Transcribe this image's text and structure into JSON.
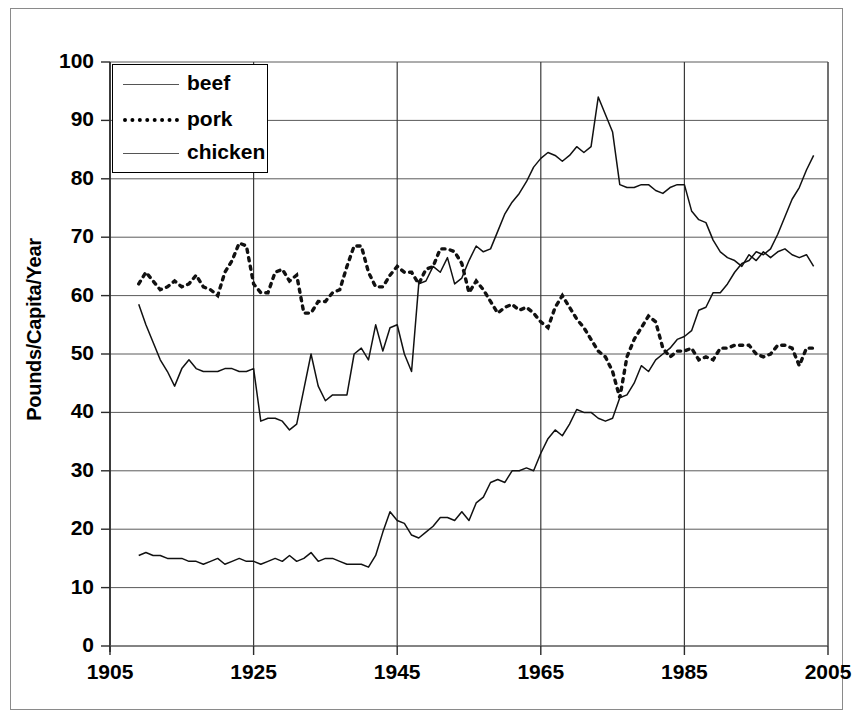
{
  "chart_data": {
    "type": "line",
    "title": "",
    "xlabel": "",
    "ylabel": "Pounds/Capita/Year",
    "xlim": [
      1905,
      2005
    ],
    "ylim": [
      0,
      100
    ],
    "xticks": [
      "1905",
      "1925",
      "1945",
      "1965",
      "1985",
      "2005"
    ],
    "yticks": [
      "0",
      "10",
      "20",
      "30",
      "40",
      "50",
      "60",
      "70",
      "80",
      "90",
      "100"
    ],
    "grid": true,
    "legend": {
      "position": "top-left",
      "entries": [
        {
          "label": "beef",
          "style": "solid"
        },
        {
          "label": "pork",
          "style": "dotted"
        },
        {
          "label": "chicken",
          "style": "solid"
        }
      ]
    },
    "x": [
      1909,
      1910,
      1911,
      1912,
      1913,
      1914,
      1915,
      1916,
      1917,
      1918,
      1919,
      1920,
      1921,
      1922,
      1923,
      1924,
      1925,
      1926,
      1927,
      1928,
      1929,
      1930,
      1931,
      1932,
      1933,
      1934,
      1935,
      1936,
      1937,
      1938,
      1939,
      1940,
      1941,
      1942,
      1943,
      1944,
      1945,
      1946,
      1947,
      1948,
      1949,
      1950,
      1951,
      1952,
      1953,
      1954,
      1955,
      1956,
      1957,
      1958,
      1959,
      1960,
      1961,
      1962,
      1963,
      1964,
      1965,
      1966,
      1967,
      1968,
      1969,
      1970,
      1971,
      1972,
      1973,
      1974,
      1975,
      1976,
      1977,
      1978,
      1979,
      1980,
      1981,
      1982,
      1983,
      1984,
      1985,
      1986,
      1987,
      1988,
      1989,
      1990,
      1991,
      1992,
      1993,
      1994,
      1995,
      1996,
      1997,
      1998,
      1999,
      2000,
      2001,
      2002,
      2003
    ],
    "series": [
      {
        "name": "beef",
        "style": "solid",
        "values": [
          58.5,
          55.0,
          52.0,
          49.0,
          47.0,
          44.5,
          47.5,
          49.0,
          47.5,
          47.0,
          47.0,
          47.0,
          47.5,
          47.5,
          47.0,
          47.0,
          47.5,
          38.5,
          39.0,
          39.0,
          38.5,
          37.0,
          38.0,
          44.0,
          50.0,
          44.5,
          42.0,
          43.0,
          43.0,
          43.0,
          50.0,
          51.0,
          49.0,
          55.0,
          50.5,
          54.5,
          55.0,
          50.0,
          47.0,
          62.0,
          62.5,
          65.0,
          64.0,
          66.5,
          62.0,
          63.0,
          66.0,
          68.5,
          67.5,
          68.0,
          71.0,
          74.0,
          76.0,
          77.5,
          79.5,
          82.0,
          83.5,
          84.5,
          84.0,
          83.0,
          84.0,
          85.5,
          84.5,
          85.5,
          94.0,
          91.0,
          88.0,
          79.0,
          78.5,
          78.5,
          79.0,
          79.0,
          78.0,
          77.5,
          78.5,
          79.0,
          79.0,
          74.5,
          73.0,
          72.5,
          69.5,
          67.5,
          66.5,
          66.0,
          65.0,
          67.0,
          66.0,
          67.5,
          66.5,
          67.5,
          68.0,
          67.0,
          66.5,
          67.0,
          65.0
        ]
      },
      {
        "name": "pork",
        "style": "dotted",
        "values": [
          62.0,
          64.0,
          62.5,
          61.0,
          61.5,
          62.5,
          61.5,
          62.0,
          63.5,
          61.5,
          61.0,
          60.0,
          64.0,
          66.0,
          69.0,
          68.5,
          62.0,
          60.5,
          60.5,
          64.0,
          64.5,
          62.5,
          63.5,
          57.0,
          57.0,
          59.0,
          59.0,
          60.5,
          61.0,
          65.0,
          68.5,
          68.5,
          64.0,
          61.5,
          61.5,
          63.5,
          65.0,
          64.0,
          64.0,
          62.0,
          64.5,
          65.0,
          68.0,
          68.0,
          67.5,
          65.5,
          60.5,
          62.5,
          61.0,
          59.0,
          57.0,
          58.0,
          58.5,
          57.5,
          58.0,
          57.0,
          55.5,
          54.5,
          58.0,
          60.0,
          58.0,
          56.0,
          54.5,
          52.5,
          50.5,
          49.5,
          47.0,
          42.5,
          49.5,
          52.5,
          54.5,
          56.5,
          55.5,
          51.0,
          49.5,
          50.5,
          50.5,
          51.0,
          49.0,
          49.5,
          49.0,
          51.0,
          51.0,
          51.5,
          51.5,
          51.5,
          50.0,
          49.5,
          50.0,
          51.5,
          51.5,
          51.0,
          48.0,
          51.0,
          51.0
        ]
      },
      {
        "name": "chicken",
        "style": "solid",
        "values": [
          15.5,
          16.0,
          15.5,
          15.5,
          15.0,
          15.0,
          15.0,
          14.5,
          14.5,
          14.0,
          14.5,
          15.0,
          14.0,
          14.5,
          15.0,
          14.5,
          14.5,
          14.0,
          14.5,
          15.0,
          14.5,
          15.5,
          14.5,
          15.0,
          16.0,
          14.5,
          15.0,
          15.0,
          14.5,
          14.0,
          14.0,
          14.0,
          13.5,
          15.5,
          19.5,
          23.0,
          21.5,
          21.0,
          19.0,
          18.5,
          19.5,
          20.5,
          22.0,
          22.0,
          21.5,
          23.0,
          21.5,
          24.5,
          25.5,
          28.0,
          28.5,
          28.0,
          30.0,
          30.0,
          30.5,
          30.0,
          33.0,
          35.5,
          37.0,
          36.0,
          38.0,
          40.5,
          40.0,
          40.0,
          39.0,
          38.5,
          39.0,
          42.5,
          43.0,
          45.0,
          48.0,
          47.0,
          49.0,
          50.0,
          51.0,
          52.5,
          53.0,
          54.0,
          57.5,
          58.0,
          60.5,
          60.5,
          62.0,
          64.0,
          65.5,
          66.0,
          67.5,
          67.0,
          68.0,
          70.5,
          73.5,
          76.5,
          78.5,
          81.5,
          84.0
        ]
      }
    ]
  }
}
